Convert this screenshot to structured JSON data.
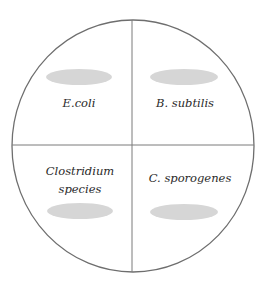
{
  "diagram": {
    "type": "agar-plate-quadrants",
    "colors": {
      "outline": "#6e6e6e",
      "divider": "#7a7a7a",
      "colony": "#d6d6d6",
      "text": "#2a2a2a",
      "background": "#ffffff"
    },
    "quadrants": [
      {
        "position": "top-left",
        "label_lines": [
          "E.coli"
        ],
        "colony_position": "above-label"
      },
      {
        "position": "top-right",
        "label_lines": [
          "B. subtilis"
        ],
        "colony_position": "above-label"
      },
      {
        "position": "bottom-left",
        "label_lines": [
          "Clostridium",
          "species"
        ],
        "colony_position": "below-label"
      },
      {
        "position": "bottom-right",
        "label_lines": [
          "C. sporogenes"
        ],
        "colony_position": "below-label"
      }
    ]
  }
}
